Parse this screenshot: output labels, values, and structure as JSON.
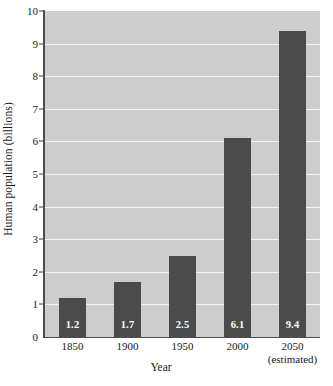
{
  "chart_data": {
    "type": "bar",
    "title": "",
    "xlabel": "Year",
    "ylabel": "Human population (billions)",
    "categories": [
      "1850",
      "1900",
      "1950",
      "2000",
      "2050"
    ],
    "category_sublabels": [
      "",
      "",
      "",
      "",
      "(estimated)"
    ],
    "values": [
      1.2,
      1.7,
      2.5,
      6.1,
      9.4
    ],
    "value_labels": [
      "1.2",
      "1.7",
      "2.5",
      "6.1",
      "9.4"
    ],
    "ylim": [
      0,
      10
    ],
    "y_ticks": [
      0,
      1,
      2,
      3,
      4,
      5,
      6,
      7,
      8,
      9,
      10
    ],
    "y_tick_labels": [
      "0",
      "1",
      "2",
      "3",
      "4",
      "5",
      "6",
      "7",
      "8",
      "9",
      "10"
    ],
    "grid": true,
    "grid_axis": "y",
    "legend": "none",
    "colors": {
      "bar": "#4b4b4b",
      "plot_background": "#cdcdcd",
      "gridline": "#f2f2f2",
      "axis": "#4d4d4d",
      "value_label": "#ffffff",
      "text": "#1a1a1a",
      "page_background": "#ffffff"
    }
  }
}
